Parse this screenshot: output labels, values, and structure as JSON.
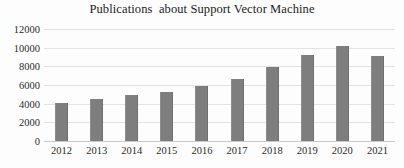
{
  "chart_data": {
    "type": "bar",
    "title": "Publications  about Support Vector Machine",
    "xlabel": "",
    "ylabel": "",
    "categories": [
      "2012",
      "2013",
      "2014",
      "2015",
      "2016",
      "2017",
      "2018",
      "2019",
      "2020",
      "2021"
    ],
    "values": [
      4100,
      4500,
      4900,
      5300,
      5900,
      6600,
      7900,
      9200,
      10200,
      9100
    ],
    "ylim": [
      0,
      12000
    ],
    "ytick_labels": [
      "12000",
      "10000",
      "8000",
      "6000",
      "4000",
      "2000",
      "0"
    ],
    "ytick_values": [
      12000,
      10000,
      8000,
      6000,
      4000,
      2000,
      0
    ],
    "grid": true,
    "legend": false,
    "bar_color": "#7e7e7e",
    "grid_color": "#e3e3e3",
    "text_color": "#2b2b2b"
  }
}
